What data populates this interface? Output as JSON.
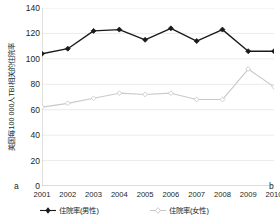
{
  "chart_data": {
    "type": "line",
    "title": "",
    "xlabel": "",
    "ylabel": "美国每100 000人TBI相关的住院率",
    "categories": [
      "2001",
      "2002",
      "2003",
      "2004",
      "2005",
      "2006",
      "2007",
      "2008",
      "2009",
      "2010"
    ],
    "ylim": [
      0,
      140
    ],
    "y_ticks": [
      0,
      20,
      40,
      60,
      80,
      100,
      120,
      140
    ],
    "grid": true,
    "legend_position": "bottom",
    "panel_label_left": "a",
    "panel_label_right": "b",
    "series": [
      {
        "name": "住院率(男性)",
        "color": "#1a1a1a",
        "marker": "filled-diamond",
        "values": [
          104,
          108,
          122,
          123,
          115,
          124,
          114,
          123,
          106,
          106
        ]
      },
      {
        "name": "住院率(女性)",
        "color": "#c9c9c9",
        "marker": "open-diamond",
        "values": [
          62,
          65,
          69,
          73,
          72,
          73,
          68,
          68,
          92,
          78
        ]
      }
    ]
  },
  "axis": {
    "y_tick_labels": [
      "140",
      "120",
      "100",
      "80",
      "60",
      "40",
      "20",
      "0"
    ]
  }
}
